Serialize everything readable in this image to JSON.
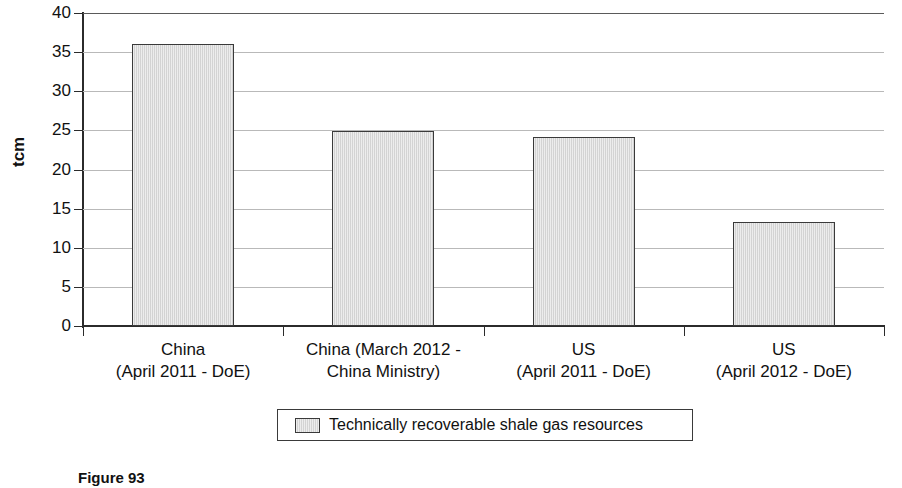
{
  "figure": {
    "caption": "Figure 93",
    "y_axis_title": "tcm"
  },
  "legend": {
    "entries": [
      {
        "label": "Technically recoverable shale gas resources",
        "swatch_color": "#d6d6d6"
      }
    ]
  },
  "axis": {
    "y_ticks": [
      "40",
      "35",
      "30",
      "25",
      "20",
      "15",
      "10",
      "5",
      "0"
    ]
  },
  "chart_data": {
    "type": "bar",
    "title": "",
    "subtitle": "",
    "xlabel": "",
    "ylabel": "tcm",
    "ylim": [
      0,
      40
    ],
    "ytick_step": 5,
    "grid": true,
    "legend_position": "bottom",
    "series_name": "Technically recoverable shale gas resources",
    "bar_color": "#d6d6d6",
    "bar_border_color": "#3a3a3a",
    "categories": [
      "China\n(April 2011 - DoE)",
      "China (March 2012 -\nChina Ministry)",
      "US\n(April 2011 - DoE)",
      "US\n(April 2012 - DoE)"
    ],
    "category_lines": [
      {
        "line1": "China",
        "line2": "(April 2011 - DoE)"
      },
      {
        "line1": "China (March 2012 -",
        "line2": "China Ministry)"
      },
      {
        "line1": "US",
        "line2": "(April 2011 - DoE)"
      },
      {
        "line1": "US",
        "line2": "(April 2012 - DoE)"
      }
    ],
    "values": [
      36.0,
      24.9,
      24.1,
      13.3
    ],
    "series": [
      {
        "name": "Technically recoverable shale gas resources",
        "values": [
          36.0,
          24.9,
          24.1,
          13.3
        ]
      }
    ]
  }
}
